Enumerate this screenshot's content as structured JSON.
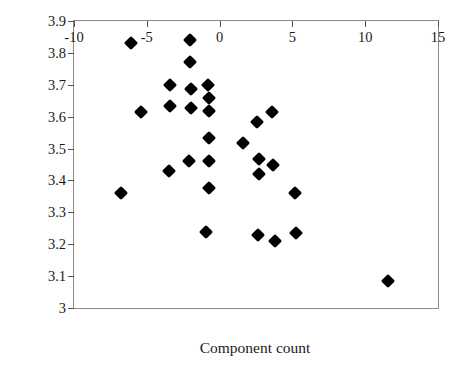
{
  "chart_data": {
    "type": "scatter",
    "title": "",
    "xlabel": "Component count",
    "ylabel": "Log (identification time)",
    "xlim": [
      -10,
      15
    ],
    "ylim": [
      3,
      3.9
    ],
    "xticks": [
      "-10",
      "-5",
      "0",
      "5",
      "10",
      "15"
    ],
    "xtick_values": [
      -10,
      -5,
      0,
      5,
      10,
      15
    ],
    "yticks": [
      "3.9",
      "3.8",
      "3.7",
      "3.6",
      "3.5",
      "3.4",
      "3.3",
      "3.2",
      "3.1",
      "3"
    ],
    "ytick_values": [
      3.9,
      3.8,
      3.7,
      3.6,
      3.5,
      3.4,
      3.3,
      3.2,
      3.1,
      3.0
    ],
    "grid": false,
    "legend": null,
    "marker": "filled-diamond",
    "marker_color": "#000000",
    "frame_color": "#8b8b8b",
    "background": "#ffffff",
    "n_points": 33,
    "points": [
      {
        "x": -6.8,
        "y": 3.36
      },
      {
        "x": -6.1,
        "y": 3.83
      },
      {
        "x": -5.4,
        "y": 3.615
      },
      {
        "x": -3.4,
        "y": 3.7
      },
      {
        "x": -3.4,
        "y": 3.633
      },
      {
        "x": -3.45,
        "y": 3.43
      },
      {
        "x": -2.0,
        "y": 3.84
      },
      {
        "x": -2.0,
        "y": 3.772
      },
      {
        "x": -1.95,
        "y": 3.688
      },
      {
        "x": -1.95,
        "y": 3.627
      },
      {
        "x": -2.1,
        "y": 3.46
      },
      {
        "x": -0.8,
        "y": 3.7
      },
      {
        "x": -0.75,
        "y": 3.657
      },
      {
        "x": -0.75,
        "y": 3.617
      },
      {
        "x": -0.7,
        "y": 3.533
      },
      {
        "x": -0.75,
        "y": 3.46
      },
      {
        "x": -0.75,
        "y": 3.377
      },
      {
        "x": -0.9,
        "y": 3.237
      },
      {
        "x": 1.6,
        "y": 3.517
      },
      {
        "x": 2.6,
        "y": 3.582
      },
      {
        "x": 2.7,
        "y": 3.467
      },
      {
        "x": 2.7,
        "y": 3.42
      },
      {
        "x": 2.65,
        "y": 3.228
      },
      {
        "x": 3.6,
        "y": 3.615
      },
      {
        "x": 3.7,
        "y": 3.45
      },
      {
        "x": 3.8,
        "y": 3.21
      },
      {
        "x": 5.2,
        "y": 3.36
      },
      {
        "x": 5.25,
        "y": 3.235
      },
      {
        "x": 11.6,
        "y": 3.085
      }
    ]
  }
}
